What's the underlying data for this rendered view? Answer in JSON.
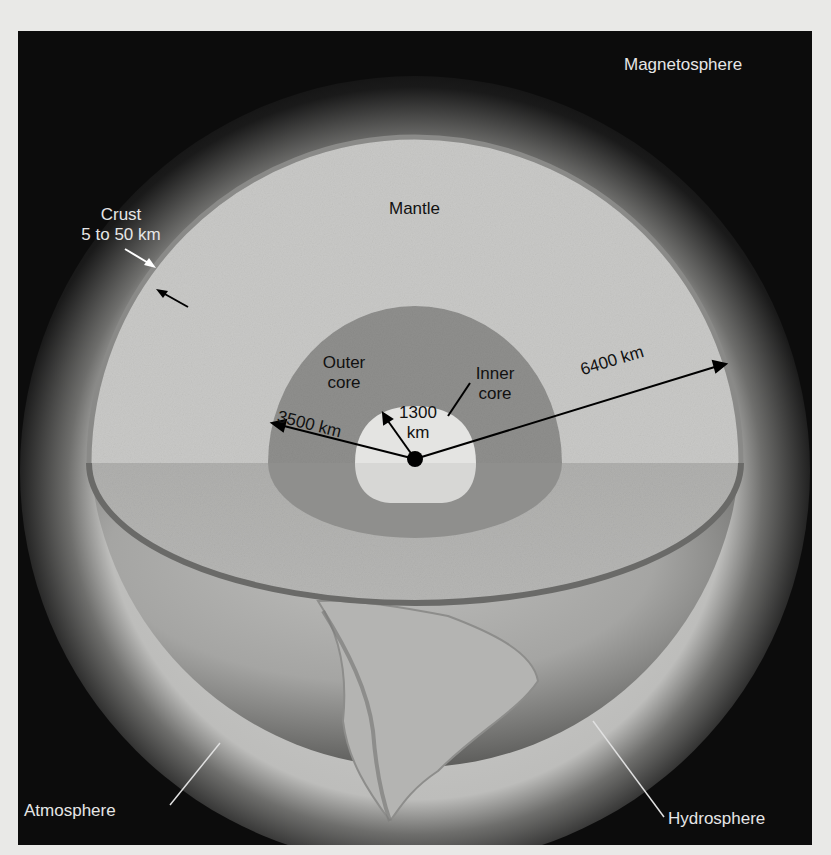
{
  "figure": {
    "type": "earth-cross-section",
    "background_color": "#0c0c0c",
    "colors": {
      "mantle": "#c9c9c7",
      "outer_core": "#8f8f8d",
      "inner_core": "#e4e4e2",
      "crust": "#6a6a68",
      "atmosphere_glow": "#bdbdbb",
      "center_dot": "#000000"
    }
  },
  "labels": {
    "magnetosphere": "Magnetosphere",
    "crust_title": "Crust",
    "crust_range": "5 to 50 km",
    "mantle": "Mantle",
    "outer_core_line1": "Outer",
    "outer_core_line2": "core",
    "inner_core_line1": "Inner",
    "inner_core_line2": "core",
    "radius_inner_value": "1300",
    "radius_inner_unit": "km",
    "radius_outer_core": "3500 km",
    "radius_earth": "6400 km",
    "atmosphere": "Atmosphere",
    "hydrosphere": "Hydrosphere"
  }
}
